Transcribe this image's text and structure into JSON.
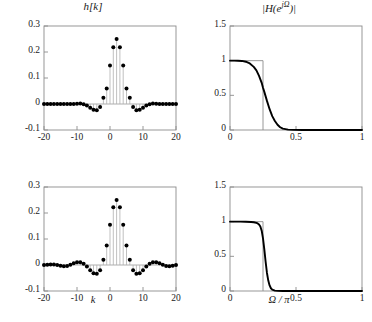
{
  "figure": {
    "background": "#ffffff",
    "curve_color": "#000000",
    "ideal_color": "#8c8c8c",
    "axis_color": "#8c8c8c",
    "stem_color": "#b0b0b0"
  },
  "chart_data": [
    {
      "id": "top-left",
      "type": "scatter",
      "title": "h[k]",
      "xlabel": "",
      "ylabel": "",
      "xlim": [
        -20,
        20
      ],
      "ylim": [
        -0.1,
        0.3
      ],
      "xticks": [
        -20,
        -10,
        0,
        10,
        20
      ],
      "xticklabels": [
        "-20",
        "-10",
        "0",
        "10",
        "20"
      ],
      "yticks": [
        -0.1,
        0,
        0.1,
        0.2,
        0.3
      ],
      "yticklabels": [
        "-0.1",
        "0",
        "0.1",
        "0.2",
        "0.3"
      ],
      "grid": false,
      "legend": "none",
      "marker": "filled-circle",
      "stems": true,
      "note": "Windowed sinc impulse response, truncated near |k|<=10",
      "x": [
        -20,
        -19,
        -18,
        -17,
        -16,
        -15,
        -14,
        -13,
        -12,
        -11,
        -10,
        -9,
        -8,
        -7,
        -6,
        -5,
        -4,
        -3,
        -2,
        -1,
        0,
        1,
        2,
        3,
        4,
        5,
        6,
        7,
        8,
        9,
        10,
        11,
        12,
        13,
        14,
        15,
        16,
        17,
        18,
        19,
        20
      ],
      "values": [
        0,
        0,
        0,
        0,
        0,
        0,
        0,
        0,
        0,
        0,
        0.001,
        0.002,
        -0.001,
        -0.006,
        -0.014,
        -0.022,
        -0.024,
        -0.012,
        0.024,
        0.06,
        0.148,
        0.218,
        0.25,
        0.218,
        0.148,
        0.06,
        0.024,
        -0.012,
        -0.024,
        -0.022,
        -0.014,
        -0.006,
        -0.001,
        0.002,
        0.001,
        0,
        0,
        0,
        0,
        0,
        0
      ]
    },
    {
      "id": "top-right",
      "type": "line",
      "title": "|H(e^{jΩ})|",
      "title_parts": {
        "base": "|H(e",
        "exponent": "jΩ",
        "tail": ")|"
      },
      "xlabel": "",
      "ylabel": "",
      "xlim": [
        0,
        1
      ],
      "ylim": [
        0,
        1.5
      ],
      "xticks": [
        0,
        0.5,
        1
      ],
      "xticklabels": [
        "0",
        "0.5",
        "1"
      ],
      "yticks": [
        0,
        0.5,
        1,
        1.5
      ],
      "yticklabels": [
        "0",
        "0.5",
        "1",
        "1.5"
      ],
      "grid": false,
      "legend": "none",
      "cutoff": 0.25,
      "transition_width": 0.17,
      "ideal_box": {
        "from": 0,
        "to": 0.25,
        "height": 1
      },
      "series": [
        {
          "name": "magnitude response (short filter)",
          "x": [
            0,
            0.03,
            0.06,
            0.09,
            0.12,
            0.15,
            0.18,
            0.2,
            0.22,
            0.24,
            0.25,
            0.26,
            0.28,
            0.3,
            0.32,
            0.34,
            0.36,
            0.38,
            0.4,
            0.44,
            0.48,
            0.55,
            0.65,
            0.75,
            0.85,
            1.0
          ],
          "values": [
            1.0,
            1.0,
            0.999,
            0.996,
            0.985,
            0.96,
            0.91,
            0.86,
            0.78,
            0.68,
            0.61,
            0.55,
            0.42,
            0.3,
            0.2,
            0.13,
            0.075,
            0.04,
            0.02,
            0.006,
            0.002,
            0.001,
            0.0,
            0.0,
            0.0,
            0.0
          ]
        }
      ]
    },
    {
      "id": "bottom-left",
      "type": "scatter",
      "title": "",
      "xlabel": "k",
      "ylabel": "",
      "xlim": [
        -20,
        20
      ],
      "ylim": [
        -0.1,
        0.3
      ],
      "xticks": [
        -20,
        -10,
        0,
        10,
        20
      ],
      "xticklabels": [
        "-20",
        "-10",
        "0",
        "10",
        "20"
      ],
      "yticks": [
        -0.1,
        0,
        0.1,
        0.2,
        0.3
      ],
      "yticklabels": [
        "-0.1",
        "0",
        "0.1",
        "0.2",
        "0.3"
      ],
      "grid": false,
      "legend": "none",
      "marker": "filled-circle",
      "stems": true,
      "note": "Longer windowed sinc impulse response with visible side lobes out to k = +/-20",
      "x": [
        -20,
        -19,
        -18,
        -17,
        -16,
        -15,
        -14,
        -13,
        -12,
        -11,
        -10,
        -9,
        -8,
        -7,
        -6,
        -5,
        -4,
        -3,
        -2,
        -1,
        0,
        1,
        2,
        3,
        4,
        5,
        6,
        7,
        8,
        9,
        10,
        11,
        12,
        13,
        14,
        15,
        16,
        17,
        18,
        19,
        20
      ],
      "values": [
        0,
        0.001,
        0.002,
        0.002,
        0,
        -0.003,
        -0.005,
        -0.004,
        0.001,
        0.007,
        0.011,
        0.011,
        0.005,
        -0.006,
        -0.02,
        -0.032,
        -0.034,
        -0.02,
        0.02,
        0.075,
        0.155,
        0.222,
        0.25,
        0.222,
        0.155,
        0.075,
        0.02,
        -0.02,
        -0.034,
        -0.032,
        -0.02,
        -0.006,
        0.005,
        0.011,
        0.011,
        0.007,
        0.001,
        -0.004,
        -0.005,
        -0.003,
        0
      ]
    },
    {
      "id": "bottom-right",
      "type": "line",
      "title": "",
      "xlabel": "Ω / π",
      "ylabel": "",
      "xlim": [
        0,
        1
      ],
      "ylim": [
        0,
        1.5
      ],
      "xticks": [
        0,
        0.5,
        1
      ],
      "xticklabels": [
        "0",
        "0.5",
        "1"
      ],
      "yticks": [
        0,
        0.5,
        1,
        1.5
      ],
      "yticklabels": [
        "0",
        "0.5",
        "1",
        "1.5"
      ],
      "grid": false,
      "legend": "none",
      "cutoff": 0.25,
      "transition_width": 0.09,
      "ideal_box": {
        "from": 0,
        "to": 0.25,
        "height": 1
      },
      "series": [
        {
          "name": "magnitude response (long filter)",
          "x": [
            0,
            0.04,
            0.08,
            0.12,
            0.16,
            0.18,
            0.2,
            0.21,
            0.22,
            0.23,
            0.24,
            0.25,
            0.26,
            0.27,
            0.28,
            0.29,
            0.3,
            0.31,
            0.32,
            0.34,
            0.36,
            0.4,
            0.5,
            0.6,
            0.75,
            1.0
          ],
          "values": [
            1.0,
            1.0,
            1.0,
            0.999,
            0.996,
            0.992,
            0.983,
            0.975,
            0.96,
            0.93,
            0.87,
            0.76,
            0.6,
            0.42,
            0.26,
            0.15,
            0.08,
            0.04,
            0.02,
            0.006,
            0.002,
            0.001,
            0.0,
            0.0,
            0.0,
            0.0
          ]
        }
      ]
    }
  ]
}
